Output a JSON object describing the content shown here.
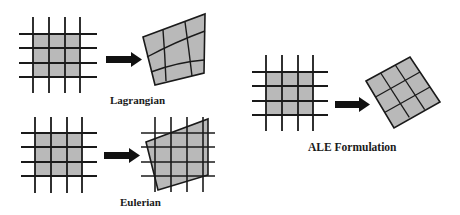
{
  "labels": {
    "lagrangian": "Lagrangian",
    "eulerian": "Eulerian",
    "ale": "ALE Formulation"
  },
  "colors": {
    "fill": "#b9b9b9",
    "line": "#1a1a1a",
    "background": "#ffffff"
  },
  "panels": [
    {
      "name": "lagrangian",
      "description": "Grid mesh deforms with material (mesh lines follow deformed body)"
    },
    {
      "name": "eulerian",
      "description": "Fixed grid; material body moves through it"
    },
    {
      "name": "ale",
      "description": "Mesh moves independently with the body (rotated regular mesh)"
    }
  ]
}
